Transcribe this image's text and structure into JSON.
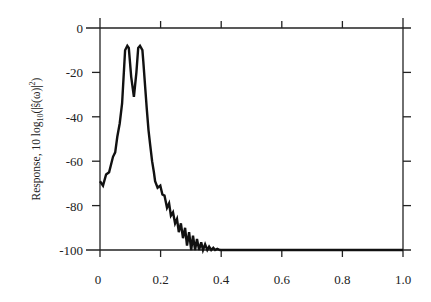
{
  "chart_data": {
    "type": "line",
    "title": "",
    "xlabel": "",
    "ylabel": "Response, 10 log10(|ŝ(ω)|²)",
    "ylabel_parts": {
      "main": "Response,  10 log",
      "sub": "10",
      "tail": "(|ŝ(ω)|",
      "sup": "2",
      "end": ")"
    },
    "xlim": [
      0,
      1.0
    ],
    "ylim": [
      -100,
      0
    ],
    "xticks": [
      0,
      0.2,
      0.4,
      0.6,
      0.8,
      1.0
    ],
    "xtick_labels": [
      "0",
      "0.2",
      "0.4",
      "0.6",
      "0.8",
      "1.0"
    ],
    "yticks": [
      0,
      -20,
      -40,
      -60,
      -80,
      -100
    ],
    "ytick_labels": [
      "0",
      "-20",
      "-40",
      "-60",
      "-80",
      "-100"
    ],
    "grid": false,
    "legend": null,
    "series": [
      {
        "name": "response",
        "color": "#111111",
        "x": [
          0.0,
          0.01,
          0.02,
          0.03,
          0.043,
          0.05,
          0.057,
          0.065,
          0.073,
          0.078,
          0.083,
          0.09,
          0.095,
          0.103,
          0.112,
          0.12,
          0.126,
          0.132,
          0.14,
          0.143,
          0.15,
          0.154,
          0.16,
          0.165,
          0.172,
          0.178,
          0.182,
          0.19,
          0.199,
          0.206,
          0.213,
          0.221,
          0.228,
          0.234,
          0.241,
          0.248,
          0.254,
          0.26,
          0.267,
          0.274,
          0.281,
          0.287,
          0.294,
          0.301,
          0.307,
          0.314,
          0.32,
          0.327,
          0.334,
          0.34,
          0.347,
          0.354,
          0.36,
          0.367,
          0.374,
          0.38,
          0.387,
          0.396,
          0.45,
          0.55,
          0.65,
          0.75,
          0.85,
          0.95,
          1.0
        ],
        "y": [
          -69,
          -71,
          -66,
          -65,
          -58,
          -56,
          -49,
          -43,
          -34,
          -22,
          -10,
          -8,
          -9,
          -22,
          -31,
          -20,
          -9,
          -8,
          -10,
          -15,
          -28,
          -36,
          -46,
          -52,
          -60,
          -65,
          -69,
          -72,
          -71,
          -75,
          -75.5,
          -81,
          -79,
          -84.5,
          -83,
          -88,
          -86,
          -92,
          -88,
          -94.7,
          -90,
          -98,
          -92,
          -100,
          -93.5,
          -100,
          -95,
          -100,
          -96.5,
          -100,
          -97.5,
          -100,
          -98.5,
          -100,
          -99,
          -100,
          -99.5,
          -100,
          -100,
          -100,
          -100,
          -100,
          -100,
          -100,
          -100
        ]
      }
    ]
  }
}
